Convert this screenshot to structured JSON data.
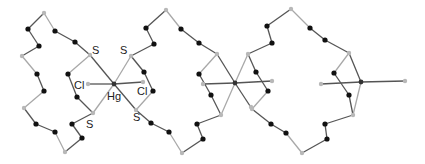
{
  "diagram": {
    "type": "molecular-structure",
    "colors": {
      "bond_dark": "#555555",
      "bond_light": "#a8a8a8",
      "carbon": "#111111",
      "heteroatom": "#b8b8b8",
      "metal": "#333333",
      "label": "#222222"
    },
    "labels": [
      {
        "text": "S",
        "x": 92,
        "y": 54
      },
      {
        "text": "S",
        "x": 120,
        "y": 54
      },
      {
        "text": "Cl",
        "x": 74,
        "y": 89
      },
      {
        "text": "Hg",
        "x": 107,
        "y": 100
      },
      {
        "text": "Cl",
        "x": 137,
        "y": 95
      },
      {
        "text": "S",
        "x": 86,
        "y": 128
      },
      {
        "text": "S",
        "x": 133,
        "y": 121
      }
    ],
    "metals": [
      {
        "name": "Hg",
        "x": 114,
        "y": 84
      },
      {
        "name": "Hg",
        "x": 235,
        "y": 83
      },
      {
        "name": "Hg",
        "x": 361,
        "y": 82
      }
    ],
    "grey_atoms": [
      [
        44,
        13
      ],
      [
        22,
        56
      ],
      [
        24,
        108
      ],
      [
        65,
        152
      ],
      [
        90,
        55
      ],
      [
        131,
        56
      ],
      [
        93,
        113
      ],
      [
        136,
        110
      ],
      [
        88,
        84
      ],
      [
        143,
        82
      ],
      [
        166,
        10
      ],
      [
        182,
        153
      ],
      [
        217,
        54
      ],
      [
        248,
        54
      ],
      [
        221,
        115
      ],
      [
        252,
        109
      ],
      [
        203,
        84
      ],
      [
        272,
        81
      ],
      [
        291,
        9
      ],
      [
        302,
        153
      ],
      [
        349,
        53
      ],
      [
        353,
        115
      ],
      [
        321,
        84
      ],
      [
        405,
        81
      ],
      [
        251,
        107
      ]
    ],
    "black_atoms": [
      [
        28,
        29
      ],
      [
        39,
        46
      ],
      [
        55,
        31
      ],
      [
        75,
        42
      ],
      [
        37,
        74
      ],
      [
        44,
        91
      ],
      [
        36,
        124
      ],
      [
        55,
        132
      ],
      [
        82,
        138
      ],
      [
        72,
        124
      ],
      [
        68,
        74
      ],
      [
        77,
        97
      ],
      [
        146,
        28
      ],
      [
        154,
        44
      ],
      [
        181,
        29
      ],
      [
        199,
        43
      ],
      [
        144,
        72
      ],
      [
        153,
        91
      ],
      [
        151,
        123
      ],
      [
        169,
        132
      ],
      [
        197,
        124
      ],
      [
        203,
        139
      ],
      [
        199,
        74
      ],
      [
        211,
        95
      ],
      [
        256,
        72
      ],
      [
        268,
        91
      ],
      [
        267,
        26
      ],
      [
        272,
        43
      ],
      [
        310,
        28
      ],
      [
        325,
        40
      ],
      [
        271,
        124
      ],
      [
        286,
        133
      ],
      [
        325,
        124
      ],
      [
        327,
        139
      ],
      [
        334,
        73
      ],
      [
        349,
        95
      ]
    ],
    "bonds": [
      {
        "from": [
          44,
          13
        ],
        "to": [
          28,
          29
        ],
        "tone": "dark"
      },
      {
        "from": [
          28,
          29
        ],
        "to": [
          39,
          46
        ],
        "tone": "dark"
      },
      {
        "from": [
          39,
          46
        ],
        "to": [
          22,
          56
        ],
        "tone": "dark"
      },
      {
        "from": [
          22,
          56
        ],
        "to": [
          37,
          74
        ],
        "tone": "light"
      },
      {
        "from": [
          37,
          74
        ],
        "to": [
          44,
          91
        ],
        "tone": "dark"
      },
      {
        "from": [
          44,
          91
        ],
        "to": [
          24,
          108
        ],
        "tone": "light"
      },
      {
        "from": [
          24,
          108
        ],
        "to": [
          36,
          124
        ],
        "tone": "dark"
      },
      {
        "from": [
          36,
          124
        ],
        "to": [
          55,
          132
        ],
        "tone": "dark"
      },
      {
        "from": [
          55,
          132
        ],
        "to": [
          65,
          152
        ],
        "tone": "light"
      },
      {
        "from": [
          65,
          152
        ],
        "to": [
          82,
          138
        ],
        "tone": "dark"
      },
      {
        "from": [
          82,
          138
        ],
        "to": [
          72,
          124
        ],
        "tone": "dark"
      },
      {
        "from": [
          72,
          124
        ],
        "to": [
          93,
          113
        ],
        "tone": "dark"
      },
      {
        "from": [
          44,
          13
        ],
        "to": [
          55,
          31
        ],
        "tone": "light"
      },
      {
        "from": [
          55,
          31
        ],
        "to": [
          75,
          42
        ],
        "tone": "dark"
      },
      {
        "from": [
          75,
          42
        ],
        "to": [
          90,
          55
        ],
        "tone": "dark"
      },
      {
        "from": [
          90,
          55
        ],
        "to": [
          68,
          74
        ],
        "tone": "light"
      },
      {
        "from": [
          68,
          74
        ],
        "to": [
          77,
          97
        ],
        "tone": "dark"
      },
      {
        "from": [
          77,
          97
        ],
        "to": [
          93,
          113
        ],
        "tone": "dark"
      },
      {
        "from": [
          90,
          55
        ],
        "to": [
          114,
          84
        ],
        "tone": "dark"
      },
      {
        "from": [
          114,
          84
        ],
        "to": [
          136,
          110
        ],
        "tone": "dark"
      },
      {
        "from": [
          93,
          113
        ],
        "to": [
          114,
          84
        ],
        "tone": "light"
      },
      {
        "from": [
          114,
          84
        ],
        "to": [
          131,
          56
        ],
        "tone": "light"
      },
      {
        "from": [
          88,
          84
        ],
        "to": [
          114,
          84
        ],
        "tone": "dark"
      },
      {
        "from": [
          114,
          84
        ],
        "to": [
          143,
          82
        ],
        "tone": "dark"
      },
      {
        "from": [
          131,
          56
        ],
        "to": [
          154,
          44
        ],
        "tone": "dark"
      },
      {
        "from": [
          154,
          44
        ],
        "to": [
          146,
          28
        ],
        "tone": "dark"
      },
      {
        "from": [
          146,
          28
        ],
        "to": [
          166,
          10
        ],
        "tone": "dark"
      },
      {
        "from": [
          166,
          10
        ],
        "to": [
          181,
          29
        ],
        "tone": "light"
      },
      {
        "from": [
          181,
          29
        ],
        "to": [
          199,
          43
        ],
        "tone": "dark"
      },
      {
        "from": [
          199,
          43
        ],
        "to": [
          217,
          54
        ],
        "tone": "dark"
      },
      {
        "from": [
          131,
          56
        ],
        "to": [
          144,
          72
        ],
        "tone": "dark"
      },
      {
        "from": [
          144,
          72
        ],
        "to": [
          153,
          91
        ],
        "tone": "dark"
      },
      {
        "from": [
          153,
          91
        ],
        "to": [
          136,
          110
        ],
        "tone": "light"
      },
      {
        "from": [
          136,
          110
        ],
        "to": [
          151,
          123
        ],
        "tone": "dark"
      },
      {
        "from": [
          151,
          123
        ],
        "to": [
          169,
          132
        ],
        "tone": "dark"
      },
      {
        "from": [
          169,
          132
        ],
        "to": [
          182,
          153
        ],
        "tone": "light"
      },
      {
        "from": [
          182,
          153
        ],
        "to": [
          203,
          139
        ],
        "tone": "dark"
      },
      {
        "from": [
          203,
          139
        ],
        "to": [
          197,
          124
        ],
        "tone": "dark"
      },
      {
        "from": [
          197,
          124
        ],
        "to": [
          221,
          115
        ],
        "tone": "dark"
      },
      {
        "from": [
          217,
          54
        ],
        "to": [
          199,
          74
        ],
        "tone": "light"
      },
      {
        "from": [
          199,
          74
        ],
        "to": [
          211,
          95
        ],
        "tone": "dark"
      },
      {
        "from": [
          211,
          95
        ],
        "to": [
          221,
          115
        ],
        "tone": "dark"
      },
      {
        "from": [
          217,
          54
        ],
        "to": [
          235,
          83
        ],
        "tone": "dark"
      },
      {
        "from": [
          235,
          83
        ],
        "to": [
          252,
          109
        ],
        "tone": "dark"
      },
      {
        "from": [
          221,
          115
        ],
        "to": [
          235,
          83
        ],
        "tone": "light"
      },
      {
        "from": [
          235,
          83
        ],
        "to": [
          248,
          54
        ],
        "tone": "light"
      },
      {
        "from": [
          203,
          84
        ],
        "to": [
          235,
          83
        ],
        "tone": "dark"
      },
      {
        "from": [
          235,
          83
        ],
        "to": [
          272,
          81
        ],
        "tone": "dark"
      },
      {
        "from": [
          248,
          54
        ],
        "to": [
          256,
          72
        ],
        "tone": "dark"
      },
      {
        "from": [
          256,
          72
        ],
        "to": [
          268,
          91
        ],
        "tone": "dark"
      },
      {
        "from": [
          268,
          91
        ],
        "to": [
          252,
          109
        ],
        "tone": "light"
      },
      {
        "from": [
          248,
          54
        ],
        "to": [
          272,
          43
        ],
        "tone": "dark"
      },
      {
        "from": [
          272,
          43
        ],
        "to": [
          267,
          26
        ],
        "tone": "dark"
      },
      {
        "from": [
          267,
          26
        ],
        "to": [
          291,
          9
        ],
        "tone": "dark"
      },
      {
        "from": [
          291,
          9
        ],
        "to": [
          310,
          28
        ],
        "tone": "light"
      },
      {
        "from": [
          310,
          28
        ],
        "to": [
          325,
          40
        ],
        "tone": "dark"
      },
      {
        "from": [
          325,
          40
        ],
        "to": [
          349,
          53
        ],
        "tone": "dark"
      },
      {
        "from": [
          252,
          109
        ],
        "to": [
          271,
          124
        ],
        "tone": "dark"
      },
      {
        "from": [
          271,
          124
        ],
        "to": [
          286,
          133
        ],
        "tone": "dark"
      },
      {
        "from": [
          286,
          133
        ],
        "to": [
          302,
          153
        ],
        "tone": "light"
      },
      {
        "from": [
          302,
          153
        ],
        "to": [
          327,
          139
        ],
        "tone": "dark"
      },
      {
        "from": [
          327,
          139
        ],
        "to": [
          325,
          124
        ],
        "tone": "dark"
      },
      {
        "from": [
          325,
          124
        ],
        "to": [
          353,
          115
        ],
        "tone": "dark"
      },
      {
        "from": [
          349,
          53
        ],
        "to": [
          334,
          73
        ],
        "tone": "light"
      },
      {
        "from": [
          334,
          73
        ],
        "to": [
          349,
          95
        ],
        "tone": "dark"
      },
      {
        "from": [
          349,
          95
        ],
        "to": [
          353,
          115
        ],
        "tone": "dark"
      },
      {
        "from": [
          349,
          53
        ],
        "to": [
          361,
          82
        ],
        "tone": "dark"
      },
      {
        "from": [
          361,
          82
        ],
        "to": [
          353,
          115
        ],
        "tone": "light"
      },
      {
        "from": [
          321,
          84
        ],
        "to": [
          361,
          82
        ],
        "tone": "dark"
      },
      {
        "from": [
          361,
          82
        ],
        "to": [
          405,
          81
        ],
        "tone": "dark"
      }
    ]
  }
}
